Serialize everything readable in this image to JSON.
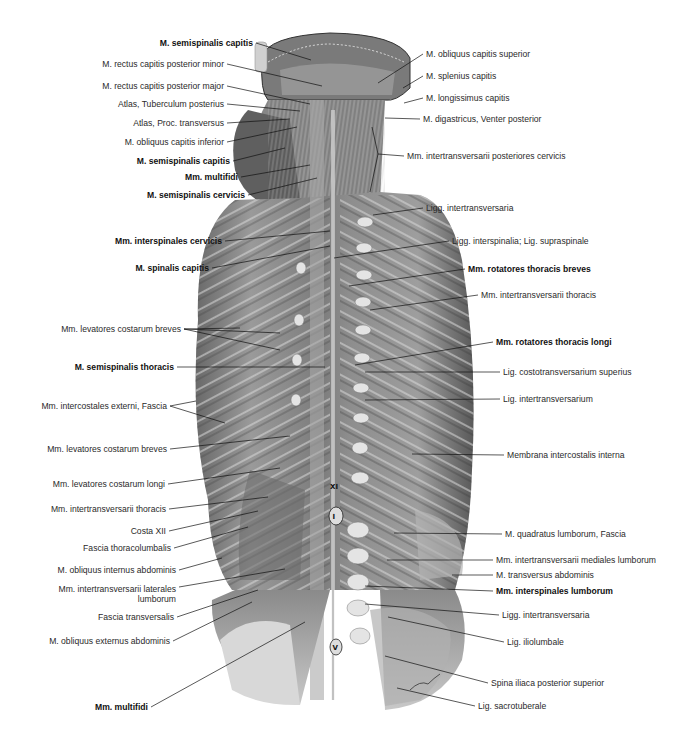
{
  "figure": {
    "signature": "Lepier",
    "colors": {
      "background": "#ffffff",
      "body_dark": "#4a4a4a",
      "body_mid": "#8a8a8a",
      "body_light": "#c8c8c8",
      "line": "#111111",
      "text": "#2a2a2a"
    }
  },
  "vertebra_markers": [
    {
      "label": "XI",
      "x": 335,
      "y": 487
    },
    {
      "label": "I",
      "x": 335,
      "y": 517
    },
    {
      "label": "V",
      "x": 335,
      "y": 648
    }
  ],
  "left_labels": [
    {
      "text": "M. semispinalis capitis",
      "bold": true,
      "right": 253,
      "y": 38,
      "to": [
        311,
        60
      ]
    },
    {
      "text": "M. rectus capitis posterior minor",
      "bold": false,
      "right": 224,
      "y": 59,
      "to": [
        322,
        86
      ]
    },
    {
      "text": "M. rectus capitis posterior major",
      "bold": false,
      "right": 224,
      "y": 81,
      "to": [
        310,
        104
      ]
    },
    {
      "text": "Atlas, Tuberculum posterius",
      "bold": false,
      "right": 224,
      "y": 99,
      "to": [
        300,
        111
      ]
    },
    {
      "text": "Atlas, Proc. transversus",
      "bold": false,
      "right": 224,
      "y": 118,
      "to": [
        290,
        119
      ]
    },
    {
      "text": "M. obliquus capitis inferior",
      "bold": false,
      "right": 224,
      "y": 137,
      "to": [
        297,
        127
      ]
    },
    {
      "text": "M. semispinalis capitis",
      "bold": true,
      "right": 230,
      "y": 156,
      "to": [
        285,
        148
      ]
    },
    {
      "text": "Mm. multifidi",
      "bold": true,
      "right": 238,
      "y": 172,
      "to": [
        310,
        165
      ]
    },
    {
      "text": "M. semispinalis cervicis",
      "bold": true,
      "right": 245,
      "y": 190,
      "to": [
        317,
        178
      ]
    },
    {
      "text": "Mm. interspinales cervicis",
      "bold": true,
      "right": 222,
      "y": 236,
      "to": [
        330,
        231
      ]
    },
    {
      "text": "M. spinalis capitis",
      "bold": true,
      "right": 209,
      "y": 263,
      "to": [
        330,
        246
      ]
    },
    {
      "text": "Mm. levatores costarum breves",
      "bold": false,
      "right": 181,
      "y": 324,
      "to": [
        240,
        328
      ],
      "to2": [
        280,
        333
      ],
      "to3": [
        280,
        350
      ]
    },
    {
      "text": "M. semispinalis thoracis",
      "bold": true,
      "right": 174,
      "y": 362,
      "to": [
        325,
        367
      ]
    },
    {
      "text": "Mm. intercostales externi, Fascia",
      "bold": false,
      "right": 167,
      "y": 401,
      "to": [
        225,
        423
      ],
      "to2": [
        196,
        401
      ]
    },
    {
      "text": "Mm. levatores costarum breves",
      "bold": false,
      "right": 167,
      "y": 444,
      "to": [
        290,
        436
      ]
    },
    {
      "text": "Mm. levatores costarum longi",
      "bold": false,
      "right": 165,
      "y": 479,
      "to": [
        280,
        468
      ]
    },
    {
      "text": "Mm. intertransversarii thoracis",
      "bold": false,
      "right": 166,
      "y": 504,
      "to": [
        268,
        497
      ]
    },
    {
      "text": "Costa XII",
      "bold": false,
      "right": 166,
      "y": 526,
      "to": [
        258,
        511
      ]
    },
    {
      "text": "Fascia thoracolumbalis",
      "bold": false,
      "right": 171,
      "y": 543,
      "to": [
        248,
        527
      ]
    },
    {
      "text": "M. obliquus internus abdominis",
      "bold": false,
      "right": 176,
      "y": 565,
      "to": [
        222,
        558
      ]
    },
    {
      "text": "Mm. intertransversarii laterales lumborum",
      "bold": false,
      "right": 176,
      "y": 584,
      "multi": true,
      "to": [
        285,
        569
      ]
    },
    {
      "text": "Fascia transversalis",
      "bold": false,
      "right": 174,
      "y": 612,
      "to": [
        258,
        590
      ]
    },
    {
      "text": "M. obliquus externus abdominis",
      "bold": false,
      "right": 170,
      "y": 636,
      "to": [
        252,
        602
      ]
    },
    {
      "text": "Mm. multifidi",
      "bold": true,
      "right": 148,
      "y": 702,
      "to": [
        305,
        622
      ]
    }
  ],
  "right_labels": [
    {
      "text": "M. obliquus capitis superior",
      "bold": false,
      "left": 426,
      "y": 49,
      "from": [
        378,
        83
      ]
    },
    {
      "text": "M. splenius capitis",
      "bold": false,
      "left": 426,
      "y": 71,
      "from": [
        403,
        88
      ]
    },
    {
      "text": "M. longissimus capitis",
      "bold": false,
      "left": 426,
      "y": 93,
      "from": [
        404,
        103
      ]
    },
    {
      "text": "M. digastricus, Venter posterior",
      "bold": false,
      "left": 423,
      "y": 114,
      "from": [
        385,
        118
      ]
    },
    {
      "text": "Mm. intertransversarii posteriores cervicis",
      "bold": false,
      "left": 407,
      "y": 151,
      "from": [
        378,
        154
      ],
      "from2": [
        372,
        127
      ],
      "from3": [
        370,
        192
      ]
    },
    {
      "text": "Ligg. intertransversaria",
      "bold": false,
      "left": 426,
      "y": 203,
      "from": [
        373,
        215
      ]
    },
    {
      "text": "Ligg. interspinalia; Lig. supraspinale",
      "bold": false,
      "left": 452,
      "y": 236,
      "from": [
        334,
        258
      ]
    },
    {
      "text": "Mm. rotatores thoracis breves",
      "bold": true,
      "left": 468,
      "y": 264,
      "from": [
        349,
        286
      ]
    },
    {
      "text": "Mm. intertransversarii thoracis",
      "bold": false,
      "left": 481,
      "y": 290,
      "from": [
        370,
        310
      ]
    },
    {
      "text": "Mm. rotatores thoracis longi",
      "bold": true,
      "left": 496,
      "y": 337,
      "from": [
        355,
        365
      ]
    },
    {
      "text": "Lig. costotransversarium superius",
      "bold": false,
      "left": 503,
      "y": 367,
      "from": [
        365,
        372
      ]
    },
    {
      "text": "Lig. intertransversarium",
      "bold": false,
      "left": 503,
      "y": 394,
      "from": [
        365,
        400
      ]
    },
    {
      "text": "Membrana intercostalis interna",
      "bold": false,
      "left": 507,
      "y": 450,
      "from": [
        412,
        454
      ]
    },
    {
      "text": "M. quadratus lumborum, Fascia",
      "bold": false,
      "left": 505,
      "y": 529,
      "from": [
        394,
        533
      ]
    },
    {
      "text": "Mm. intertransversarii mediales lumborum",
      "bold": false,
      "left": 496,
      "y": 555,
      "from": [
        387,
        560
      ]
    },
    {
      "text": "M. transversus abdominis",
      "bold": false,
      "left": 496,
      "y": 570,
      "from": [
        452,
        575
      ]
    },
    {
      "text": "Mm. interspinales lumborum",
      "bold": true,
      "left": 496,
      "y": 586,
      "from": [
        365,
        586
      ]
    },
    {
      "text": "Ligg. intertransversaria",
      "bold": false,
      "left": 502,
      "y": 610,
      "from": [
        365,
        604
      ]
    },
    {
      "text": "Lig. iliolumbale",
      "bold": false,
      "left": 507,
      "y": 637,
      "from": [
        388,
        617
      ]
    },
    {
      "text": "Spina iliaca posterior superior",
      "bold": false,
      "left": 491,
      "y": 678,
      "from": [
        385,
        656
      ]
    },
    {
      "text": "Lig. sacrotuberale",
      "bold": false,
      "left": 478,
      "y": 701,
      "from": [
        397,
        688
      ]
    }
  ]
}
